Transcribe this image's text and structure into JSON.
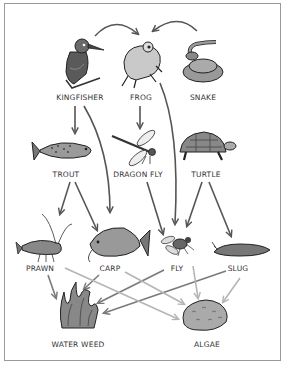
{
  "diagram": {
    "type": "food-web",
    "organisms": [
      {
        "id": "kingfisher",
        "label": "KINGFISHER",
        "x": 80,
        "y": 96
      },
      {
        "id": "frog",
        "label": "FROG",
        "x": 141,
        "y": 96
      },
      {
        "id": "snake",
        "label": "SNAKE",
        "x": 203,
        "y": 96
      },
      {
        "id": "trout",
        "label": "TROUT",
        "x": 66,
        "y": 173
      },
      {
        "id": "dragonfly",
        "label": "DRAGON FLY",
        "x": 138,
        "y": 173
      },
      {
        "id": "turtle",
        "label": "TURTLE",
        "x": 206,
        "y": 173
      },
      {
        "id": "prawn",
        "label": "PRAWN",
        "x": 40,
        "y": 266
      },
      {
        "id": "carp",
        "label": "CARP",
        "x": 110,
        "y": 266
      },
      {
        "id": "fly",
        "label": "FLY",
        "x": 177,
        "y": 266
      },
      {
        "id": "slug",
        "label": "SLUG",
        "x": 238,
        "y": 266
      },
      {
        "id": "waterweed",
        "label": "WATER WEED",
        "x": 78,
        "y": 342
      },
      {
        "id": "algae",
        "label": "ALGAE",
        "x": 207,
        "y": 342
      }
    ],
    "edges": [
      {
        "from": "kingfisher",
        "to": "frog",
        "shade": "dark"
      },
      {
        "from": "snake",
        "to": "frog",
        "shade": "dark"
      },
      {
        "from": "kingfisher",
        "to": "trout",
        "shade": "dark"
      },
      {
        "from": "kingfisher",
        "to": "carp",
        "shade": "dark"
      },
      {
        "from": "frog",
        "to": "dragonfly",
        "shade": "dark"
      },
      {
        "from": "frog",
        "to": "fly",
        "shade": "dark"
      },
      {
        "from": "trout",
        "to": "prawn",
        "shade": "dark"
      },
      {
        "from": "trout",
        "to": "carp",
        "shade": "dark"
      },
      {
        "from": "dragonfly",
        "to": "fly",
        "shade": "dark"
      },
      {
        "from": "turtle",
        "to": "fly",
        "shade": "dark"
      },
      {
        "from": "turtle",
        "to": "slug",
        "shade": "dark"
      },
      {
        "from": "prawn",
        "to": "waterweed",
        "shade": "mid"
      },
      {
        "from": "prawn",
        "to": "algae",
        "shade": "light"
      },
      {
        "from": "carp",
        "to": "waterweed",
        "shade": "mid"
      },
      {
        "from": "carp",
        "to": "algae",
        "shade": "light"
      },
      {
        "from": "fly",
        "to": "waterweed",
        "shade": "mid"
      },
      {
        "from": "fly",
        "to": "algae",
        "shade": "light"
      },
      {
        "from": "slug",
        "to": "waterweed",
        "shade": "mid"
      },
      {
        "from": "slug",
        "to": "algae",
        "shade": "light"
      }
    ],
    "colors": {
      "arrow_dark": "#555555",
      "arrow_mid": "#7a7a7a",
      "arrow_light": "#b5b5b5",
      "frame": "#9a9a9a"
    }
  }
}
